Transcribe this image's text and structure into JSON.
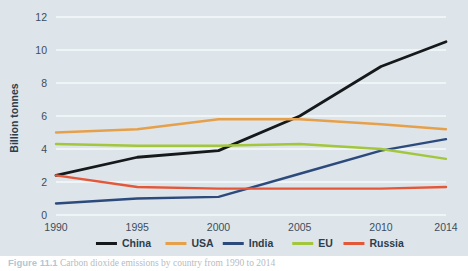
{
  "figure": {
    "caption_label": "Figure 11.1",
    "caption_text": "Carbon dioxide emissions by country from 1990 to 2014"
  },
  "axes": {
    "y_title": "Billion tonnes",
    "y_ticks": [
      "0",
      "2",
      "4",
      "6",
      "8",
      "10",
      "12"
    ],
    "x_ticks": [
      "1990",
      "1995",
      "2000",
      "2005",
      "2010",
      "2014"
    ]
  },
  "legend": {
    "position": "bottom-center",
    "entries": [
      {
        "label": "China",
        "color": "#15191c"
      },
      {
        "label": "USA",
        "color": "#e7a04a"
      },
      {
        "label": "India",
        "color": "#2c4a7c"
      },
      {
        "label": "EU",
        "color": "#a2c63c"
      },
      {
        "label": "Russia",
        "color": "#e4583a"
      }
    ]
  },
  "colors": {
    "plot_background": "#dde5ea",
    "gridline": "#f4f8fa",
    "tick_text": "#3c4d5c",
    "page_background": "#ffffff"
  },
  "chart_data": {
    "type": "line",
    "title": "",
    "xlabel": "",
    "ylabel": "Billion tonnes",
    "x": [
      1990,
      1995,
      2000,
      2005,
      2010,
      2014
    ],
    "categories": [
      "1990",
      "1995",
      "2000",
      "2005",
      "2010",
      "2014"
    ],
    "xlim": [
      1990,
      2014
    ],
    "ylim": [
      0,
      12
    ],
    "yticks": [
      0,
      2,
      4,
      6,
      8,
      10,
      12
    ],
    "grid": true,
    "legend_position": "bottom-center",
    "series": [
      {
        "name": "China",
        "color": "#15191c",
        "values": [
          2.4,
          3.5,
          3.9,
          6.0,
          9.0,
          10.5
        ]
      },
      {
        "name": "USA",
        "color": "#e7a04a",
        "values": [
          5.0,
          5.2,
          5.8,
          5.8,
          5.5,
          5.2
        ]
      },
      {
        "name": "India",
        "color": "#2c4a7c",
        "values": [
          0.7,
          1.0,
          1.1,
          2.5,
          3.9,
          4.6
        ]
      },
      {
        "name": "EU",
        "color": "#a2c63c",
        "values": [
          4.3,
          4.2,
          4.2,
          4.3,
          4.0,
          3.4
        ]
      },
      {
        "name": "Russia",
        "color": "#e4583a",
        "values": [
          2.4,
          1.7,
          1.6,
          1.6,
          1.6,
          1.7
        ]
      }
    ]
  }
}
